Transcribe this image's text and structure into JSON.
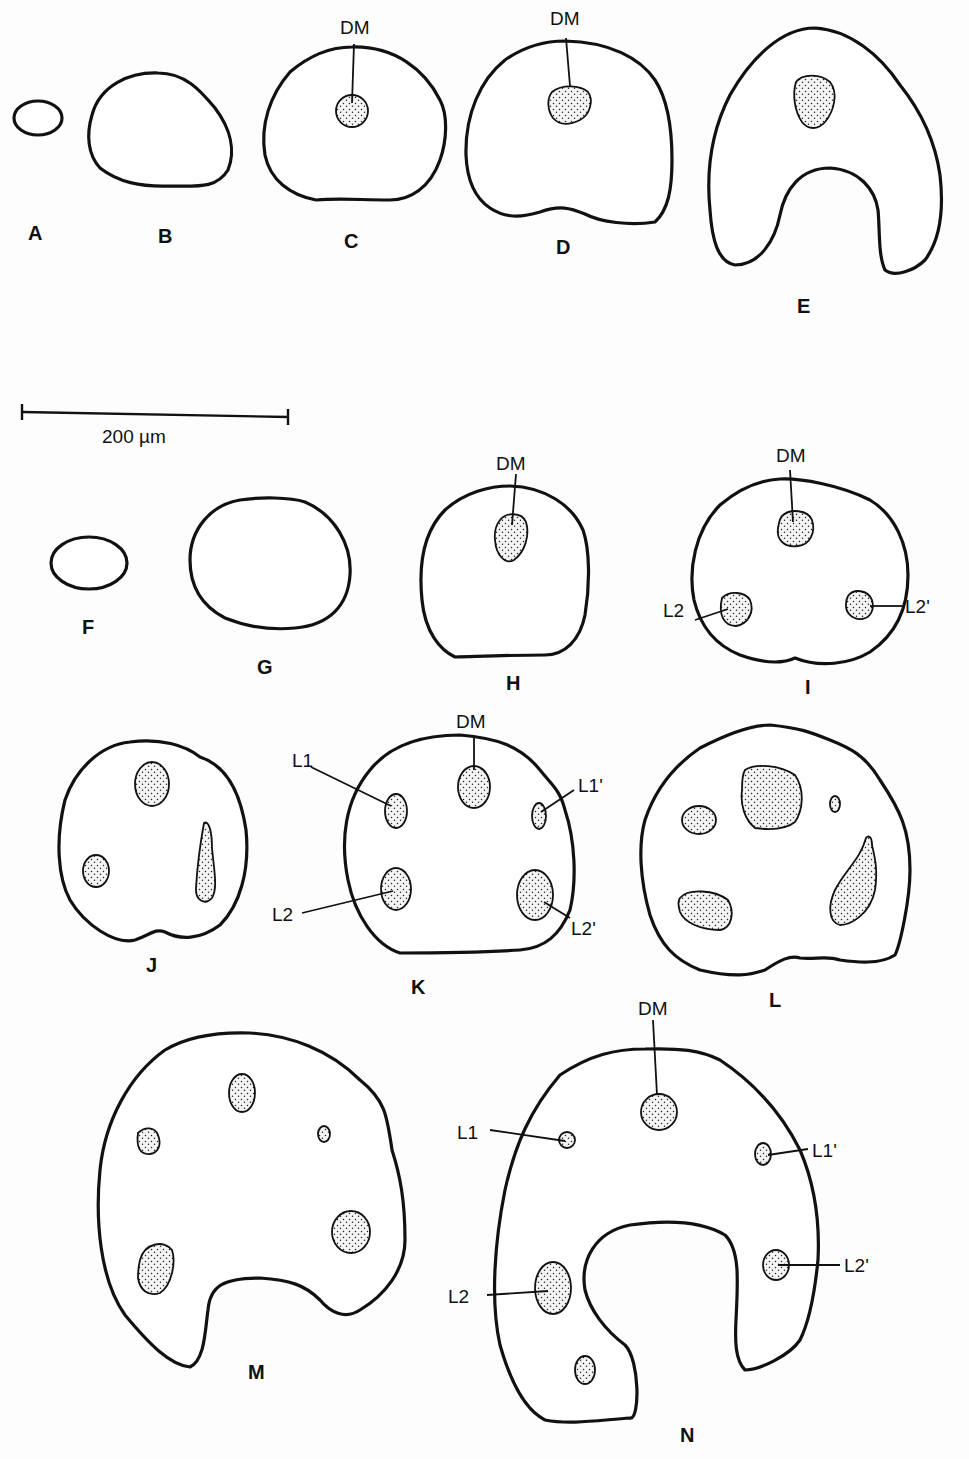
{
  "figure": {
    "scale_bar": {
      "label": "200 µm",
      "value": 200,
      "unit": "µm"
    },
    "rows": [
      {
        "series": "top",
        "panels": [
          {
            "id": "A",
            "label": "A",
            "structures": []
          },
          {
            "id": "B",
            "label": "B",
            "structures": []
          },
          {
            "id": "C",
            "label": "C",
            "structures": [
              "DM"
            ]
          },
          {
            "id": "D",
            "label": "D",
            "structures": [
              "DM"
            ]
          },
          {
            "id": "E",
            "label": "E",
            "structures": []
          }
        ]
      },
      {
        "series": "bottom",
        "panels": [
          {
            "id": "F",
            "label": "F",
            "structures": []
          },
          {
            "id": "G",
            "label": "G",
            "structures": []
          },
          {
            "id": "H",
            "label": "H",
            "structures": [
              "DM"
            ]
          },
          {
            "id": "I",
            "label": "I",
            "structures": [
              "DM",
              "L2",
              "L2'"
            ]
          },
          {
            "id": "J",
            "label": "J",
            "structures": []
          },
          {
            "id": "K",
            "label": "K",
            "structures": [
              "DM",
              "L1",
              "L1'",
              "L2",
              "L2'"
            ]
          },
          {
            "id": "L",
            "label": "L",
            "structures": []
          },
          {
            "id": "M",
            "label": "M",
            "structures": []
          },
          {
            "id": "N",
            "label": "N",
            "structures": [
              "DM",
              "L1",
              "L1'",
              "L2",
              "L2'"
            ]
          }
        ]
      }
    ],
    "labels": {
      "A": "A",
      "B": "B",
      "C": "C",
      "D": "D",
      "E": "E",
      "F": "F",
      "G": "G",
      "H": "H",
      "I": "I",
      "J": "J",
      "K": "K",
      "L": "L",
      "M": "M",
      "N": "N",
      "DM": "DM",
      "L1": "L1",
      "L1p": "L1'",
      "L2": "L2",
      "L2p": "L2'"
    }
  }
}
